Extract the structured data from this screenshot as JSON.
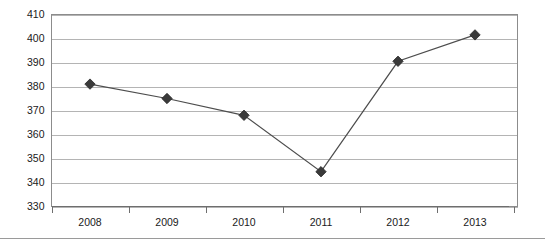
{
  "chart_data": {
    "type": "line",
    "title": "",
    "subtitle": "",
    "xlabel": "",
    "ylabel": "",
    "categories": [
      "2008",
      "2009",
      "2010",
      "2011",
      "2012",
      "2013"
    ],
    "values": [
      381,
      375,
      368,
      344.5,
      390.5,
      401.5
    ],
    "series": [
      {
        "name": "",
        "values": [
          381,
          375,
          368,
          344.5,
          390.5,
          401.5
        ],
        "marker": "diamond",
        "line_color": "#4d4d4d",
        "marker_color": "#3a3a3a"
      }
    ],
    "ylim": [
      330,
      410
    ],
    "ytick_step": 10,
    "ytick_labels": [
      "410",
      "400",
      "390",
      "380",
      "370",
      "360",
      "350",
      "340",
      "330"
    ],
    "ytick_values": [
      410,
      400,
      390,
      380,
      370,
      360,
      350,
      340,
      330
    ],
    "xtick_labels": [
      "2008",
      "2009",
      "2010",
      "2011",
      "2012",
      "2013"
    ],
    "grid": {
      "horizontal": true,
      "vertical": false,
      "color": "#b4b4b4"
    },
    "legend": {
      "visible": false,
      "position": "none",
      "entries": []
    },
    "axis": {
      "category_axis": true,
      "tick_marks_at_boundaries": true,
      "plot_border": true,
      "border_color": "#8c8c8c"
    },
    "annotations": []
  },
  "page": {
    "separator_rule": true
  },
  "colors": {
    "gridline": "#b4b4b4",
    "plot_border": "#8c8c8c",
    "axis": "#6e6e6e",
    "series_line": "#4d4d4d",
    "series_marker": "#3a3a3a",
    "text": "#1a1a1a",
    "background": "#ffffff"
  }
}
